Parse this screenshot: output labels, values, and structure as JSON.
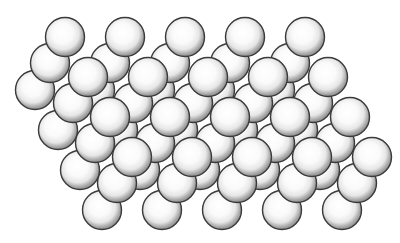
{
  "diagram": {
    "title": "Close-packed sphere layers",
    "canvas": {
      "width": 400,
      "height": 243,
      "background": "#ffffff"
    },
    "sphere": {
      "radius": 19.5,
      "outline_color": "#3a3a3a",
      "highlight_color": "#ffffff",
      "mid_color": "#e6e6e6",
      "shade_color": "#8f8f8f"
    },
    "layers": [
      {
        "name": "C",
        "depth": "back",
        "x_step": 60,
        "count_per_row": 5,
        "rows": [
          {
            "y": 90,
            "x0": 35
          },
          {
            "y": 130,
            "x0": 58
          },
          {
            "y": 170,
            "x0": 80
          },
          {
            "y": 210,
            "x0": 102
          }
        ]
      },
      {
        "name": "B",
        "depth": "middle",
        "x_step": 60,
        "count_per_row": 5,
        "rows": [
          {
            "y": 63,
            "x0": 50
          },
          {
            "y": 103,
            "x0": 73
          },
          {
            "y": 143,
            "x0": 95
          },
          {
            "y": 183,
            "x0": 117
          }
        ]
      },
      {
        "name": "A",
        "depth": "front",
        "x_step": 60,
        "count_per_row": 5,
        "rows": [
          {
            "y": 37,
            "x0": 65
          },
          {
            "y": 77,
            "x0": 88
          },
          {
            "y": 117,
            "x0": 110
          },
          {
            "y": 157,
            "x0": 132
          }
        ]
      }
    ]
  }
}
